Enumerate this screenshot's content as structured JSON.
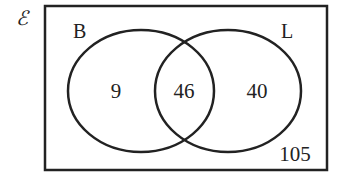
{
  "diagram": {
    "type": "venn",
    "universal_symbol": "ℰ",
    "sets": [
      {
        "label": "B"
      },
      {
        "label": "L"
      }
    ],
    "regions": {
      "only_B": "9",
      "B_and_L": "46",
      "only_L": "40",
      "neither": "105"
    },
    "colors": {
      "stroke": "#222222",
      "background": "#ffffff"
    }
  }
}
